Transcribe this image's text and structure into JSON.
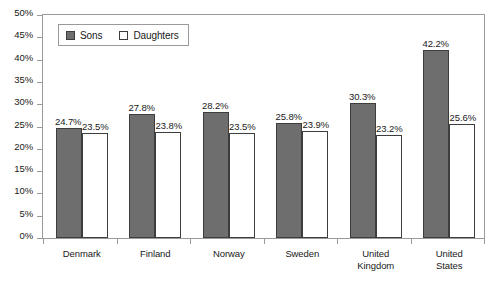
{
  "chart_data": {
    "type": "bar",
    "title": "",
    "subtitle": "",
    "xlabel": "",
    "ylabel": "",
    "categories": [
      "Denmark",
      "Finland",
      "Norway",
      "Sweden",
      "United Kingdom",
      "United States"
    ],
    "category_lines": [
      [
        "Denmark"
      ],
      [
        "Finland"
      ],
      [
        "Norway"
      ],
      [
        "Sweden"
      ],
      [
        "United",
        "Kingdom"
      ],
      [
        "United",
        "States"
      ]
    ],
    "series": [
      {
        "name": "Sons",
        "color": "#6e6e6e",
        "values": [
          24.7,
          27.8,
          28.2,
          25.8,
          30.3,
          42.2
        ],
        "labels": [
          "24.7%",
          "27.8%",
          "28.2%",
          "25.8%",
          "30.3%",
          "42.2%"
        ]
      },
      {
        "name": "Daughters",
        "color": "#ffffff",
        "values": [
          23.5,
          23.8,
          23.5,
          23.9,
          23.2,
          25.6
        ],
        "labels": [
          "23.5%",
          "23.8%",
          "23.5%",
          "23.9%",
          "23.2%",
          "25.6%"
        ]
      }
    ],
    "ylim": [
      0,
      50
    ],
    "ytick_values": [
      50,
      45,
      40,
      35,
      30,
      25,
      20,
      15,
      10,
      5,
      0
    ],
    "ytick_labels": [
      "50%",
      "45%",
      "40%",
      "35%",
      "30%",
      "25%",
      "20%",
      "15%",
      "10%",
      "5%",
      "0%"
    ],
    "grid": false,
    "legend_position": "top-left-inside",
    "frame": true
  },
  "legend": {
    "entries": [
      {
        "label": "Sons",
        "swatch": "filled-gray-square-icon"
      },
      {
        "label": "Daughters",
        "swatch": "open-white-square-icon"
      }
    ]
  }
}
